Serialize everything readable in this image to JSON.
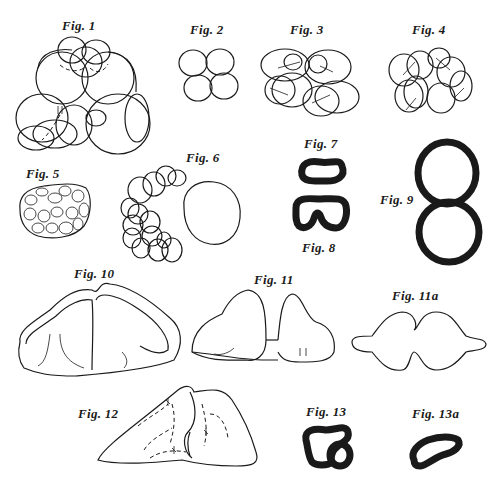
{
  "plate": {
    "figures": [
      {
        "id": "fig1",
        "label": "Fig. 1"
      },
      {
        "id": "fig2",
        "label": "Fig. 2"
      },
      {
        "id": "fig3",
        "label": "Fig. 3"
      },
      {
        "id": "fig4",
        "label": "Fig. 4"
      },
      {
        "id": "fig5",
        "label": "Fig. 5"
      },
      {
        "id": "fig6",
        "label": "Fig. 6"
      },
      {
        "id": "fig7",
        "label": "Fig. 7"
      },
      {
        "id": "fig8",
        "label": "Fig. 8"
      },
      {
        "id": "fig9",
        "label": "Fig. 9"
      },
      {
        "id": "fig10",
        "label": "Fig. 10"
      },
      {
        "id": "fig11",
        "label": "Fig. 11"
      },
      {
        "id": "fig11a",
        "label": "Fig. 11a"
      },
      {
        "id": "fig12",
        "label": "Fig. 12"
      },
      {
        "id": "fig13",
        "label": "Fig. 13"
      },
      {
        "id": "fig13a",
        "label": "Fig. 13a"
      }
    ]
  }
}
